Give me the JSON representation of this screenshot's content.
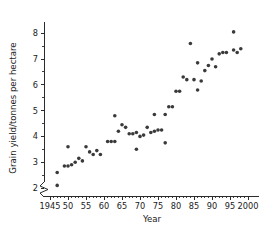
{
  "chart_data": {
    "type": "scatter",
    "title": "",
    "xlabel": "Year",
    "ylabel": "Grain yield/tonnes per hectare",
    "xlim": [
      1943,
      2001
    ],
    "ylim": [
      1.6,
      8.4
    ],
    "grid": false,
    "legend": null,
    "y_axis_break": true,
    "x_tick_labels": [
      "1945",
      "50",
      "55",
      "60",
      "65",
      "70",
      "75",
      "80",
      "85",
      "90",
      "95",
      "2000"
    ],
    "x_tick_values": [
      1945,
      1950,
      1955,
      1960,
      1965,
      1970,
      1975,
      1980,
      1985,
      1990,
      1995,
      2000
    ],
    "y_tick_labels": [
      "2",
      "3",
      "4",
      "5",
      "6",
      "7",
      "8"
    ],
    "y_tick_values": [
      2,
      3,
      4,
      5,
      6,
      7,
      8
    ],
    "y_minor_ticks": [
      2.5,
      3.5,
      4.5,
      5.5,
      6.5,
      7.5,
      8.5
    ],
    "marker": "dot",
    "marker_color": "#3a3a3a",
    "marker_size": 1.8,
    "points": [
      {
        "x": 1947,
        "y": 2.6
      },
      {
        "x": 1947,
        "y": 2.1
      },
      {
        "x": 1949,
        "y": 2.85
      },
      {
        "x": 1950,
        "y": 2.85
      },
      {
        "x": 1950,
        "y": 3.6
      },
      {
        "x": 1951,
        "y": 2.9
      },
      {
        "x": 1952,
        "y": 3.0
      },
      {
        "x": 1953,
        "y": 3.15
      },
      {
        "x": 1954,
        "y": 3.05
      },
      {
        "x": 1955,
        "y": 3.6
      },
      {
        "x": 1956,
        "y": 3.4
      },
      {
        "x": 1957,
        "y": 3.3
      },
      {
        "x": 1958,
        "y": 3.45
      },
      {
        "x": 1959,
        "y": 3.3
      },
      {
        "x": 1961,
        "y": 3.8
      },
      {
        "x": 1962,
        "y": 3.8
      },
      {
        "x": 1963,
        "y": 3.8
      },
      {
        "x": 1963,
        "y": 4.8
      },
      {
        "x": 1964,
        "y": 4.2
      },
      {
        "x": 1965,
        "y": 4.45
      },
      {
        "x": 1966,
        "y": 4.35
      },
      {
        "x": 1967,
        "y": 4.1
      },
      {
        "x": 1968,
        "y": 4.1
      },
      {
        "x": 1969,
        "y": 3.5
      },
      {
        "x": 1969,
        "y": 4.15
      },
      {
        "x": 1970,
        "y": 4.0
      },
      {
        "x": 1971,
        "y": 4.05
      },
      {
        "x": 1972,
        "y": 4.35
      },
      {
        "x": 1973,
        "y": 4.15
      },
      {
        "x": 1974,
        "y": 4.2
      },
      {
        "x": 1974,
        "y": 4.85
      },
      {
        "x": 1975,
        "y": 4.25
      },
      {
        "x": 1976,
        "y": 4.25
      },
      {
        "x": 1977,
        "y": 3.75
      },
      {
        "x": 1977,
        "y": 4.85
      },
      {
        "x": 1978,
        "y": 5.15
      },
      {
        "x": 1979,
        "y": 5.15
      },
      {
        "x": 1980,
        "y": 5.75
      },
      {
        "x": 1981,
        "y": 5.75
      },
      {
        "x": 1982,
        "y": 6.3
      },
      {
        "x": 1983,
        "y": 6.2
      },
      {
        "x": 1984,
        "y": 7.6
      },
      {
        "x": 1985,
        "y": 6.2
      },
      {
        "x": 1986,
        "y": 5.8
      },
      {
        "x": 1986,
        "y": 6.85
      },
      {
        "x": 1987,
        "y": 6.15
      },
      {
        "x": 1988,
        "y": 6.55
      },
      {
        "x": 1989,
        "y": 6.75
      },
      {
        "x": 1990,
        "y": 7.0
      },
      {
        "x": 1991,
        "y": 6.7
      },
      {
        "x": 1992,
        "y": 7.2
      },
      {
        "x": 1993,
        "y": 7.25
      },
      {
        "x": 1994,
        "y": 7.25
      },
      {
        "x": 1996,
        "y": 7.35
      },
      {
        "x": 1996,
        "y": 8.05
      },
      {
        "x": 1997,
        "y": 7.25
      },
      {
        "x": 1998,
        "y": 7.4
      }
    ]
  }
}
